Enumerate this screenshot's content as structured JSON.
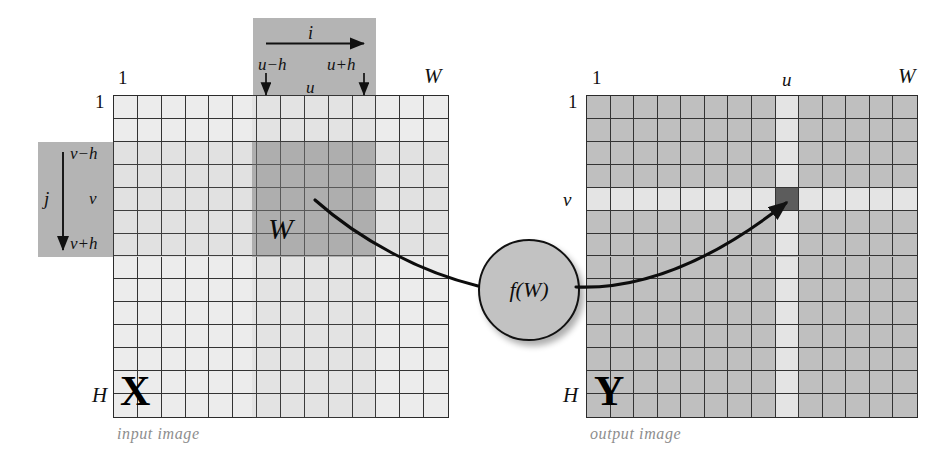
{
  "figure": {
    "background_color": "#ffffff",
    "panel_color": "#b4b4b4",
    "window_color": "#9a9a9a",
    "grid_line_color": "#333333",
    "caption_color": "#8d8d8d"
  },
  "input_image": {
    "caption": "input image",
    "matrix_letter": "X",
    "corner_top_left_col": "1",
    "corner_top_left_row": "1",
    "corner_top_right": "W",
    "corner_bottom_left": "H",
    "cols": 14,
    "rows": 14,
    "cell_fill": "#ececec"
  },
  "output_image": {
    "caption": "output image",
    "matrix_letter": "Y",
    "corner_top_left_col": "1",
    "corner_top_left_row": "1",
    "corner_top_right": "W",
    "corner_bottom_left": "H",
    "col_label_u": "u",
    "row_label_v": "v",
    "cols": 14,
    "rows": 14,
    "cell_fill": "#bfbfbf",
    "highlight_fill": "#e4e4e4",
    "target_cell_fill": "#5c5c5c",
    "target_col_index": 8,
    "target_row_index": 4
  },
  "horizontal_panel": {
    "axis_label": "i",
    "left_bound": "u−h",
    "right_bound": "u+h",
    "center": "u"
  },
  "vertical_panel": {
    "axis_label": "j",
    "top_bound": "v−h",
    "bottom_bound": "v+h",
    "center": "v"
  },
  "window": {
    "label": "𝒲",
    "label_plain": "W",
    "cols": 5,
    "rows": 5
  },
  "function_node": {
    "label_prefix": "f",
    "label": "f(𝒲)",
    "label_plain": "f(W)"
  }
}
